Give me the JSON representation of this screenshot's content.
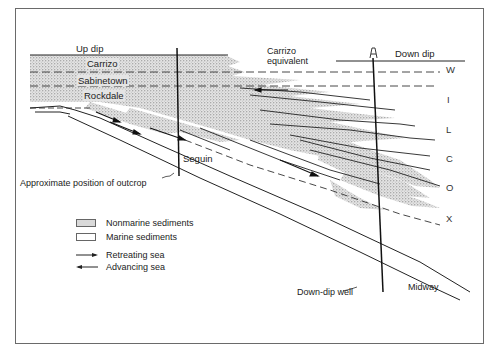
{
  "diagram": {
    "labels": {
      "up_dip": "Up dip",
      "down_dip": "Down dip",
      "carrizo": "Carrizo",
      "sabinetown": "Sabinetown",
      "rockdale": "Rockdale",
      "carrizo_equivalent_1": "Carrizo",
      "carrizo_equivalent_2": "equivalent",
      "seguin": "Seguin",
      "outcrop": "Approximate position of outcrop",
      "down_dip_well": "Down-dip well",
      "midway": "Midway"
    },
    "wilcox_letters": [
      "W",
      "I",
      "L",
      "C",
      "O",
      "X"
    ],
    "legend": {
      "nonmarine": "Nonmarine sediments",
      "marine": "Marine sediments",
      "retreating": "Retreating sea",
      "advancing": "Advancing sea"
    },
    "colors": {
      "line": "#222222",
      "stipple_bg": "#e2e2e2",
      "stipple_dot": "#6e6e6e",
      "frame": "#6a6a6a"
    }
  }
}
